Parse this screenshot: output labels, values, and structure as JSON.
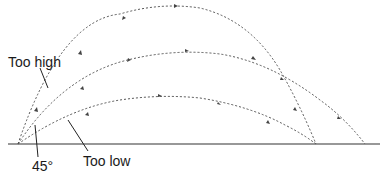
{
  "diagram": {
    "labels": {
      "too_high": "Too high",
      "angle_45": "45°",
      "too_low": "Too low"
    },
    "trajectories": [
      {
        "name": "too-high",
        "launch": [
          18,
          144
        ],
        "peak": [
          175,
          6
        ],
        "landing": [
          316,
          144
        ]
      },
      {
        "name": "45-degree",
        "launch": [
          18,
          144
        ],
        "peak": [
          190,
          52
        ],
        "landing": [
          365,
          144
        ]
      },
      {
        "name": "too-low",
        "launch": [
          18,
          144
        ],
        "peak": [
          165,
          97
        ],
        "landing": [
          316,
          144
        ]
      }
    ],
    "ground": {
      "x1": 8,
      "x2": 380,
      "y": 144
    },
    "colors": {
      "line": "#555555",
      "ground": "#333333",
      "text": "#1a1a1a"
    }
  }
}
